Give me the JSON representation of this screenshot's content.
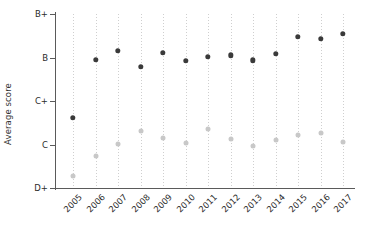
{
  "chart_data": {
    "type": "scatter",
    "title": "",
    "xlabel": "",
    "ylabel": "Average score",
    "grid": "vertical-dotted",
    "legend": "none",
    "x": [
      "2005",
      "2006",
      "2007",
      "2008",
      "2009",
      "2010",
      "2011",
      "2012",
      "2013",
      "2014",
      "2015",
      "2016",
      "2017"
    ],
    "ytick_labels": [
      "B+",
      "B",
      "C+",
      "C",
      "D+"
    ],
    "ytick_values": [
      4,
      3,
      2,
      1,
      0
    ],
    "ylim": [
      0,
      4
    ],
    "ylim_labels": [
      "D+",
      "B+"
    ],
    "series": [
      {
        "name": "dark-series",
        "color": "#3a3a3a",
        "marker": "circle",
        "values": [
          1.62,
          2.95,
          3.15,
          2.78,
          3.11,
          2.92,
          3.02,
          3.05,
          2.94,
          3.09,
          3.48,
          3.43,
          3.55
        ],
        "value_labels": [
          "C+",
          "B",
          "B",
          "B-",
          "B",
          "B",
          "B",
          "B",
          "B",
          "B",
          "B+",
          "B+",
          "B+"
        ]
      },
      {
        "name": "light-series",
        "color": "#c8c8c8",
        "marker": "circle",
        "values": [
          0.28,
          0.73,
          1.02,
          1.3,
          1.15,
          1.03,
          1.36,
          1.12,
          0.96,
          1.1,
          1.22,
          1.26,
          1.05
        ],
        "value_labels": [
          "D+",
          "C-",
          "C",
          "C+",
          "C",
          "C",
          "C+",
          "C",
          "C",
          "C",
          "C",
          "C",
          "C"
        ]
      }
    ]
  },
  "axis": {
    "y_title": "Average score"
  }
}
